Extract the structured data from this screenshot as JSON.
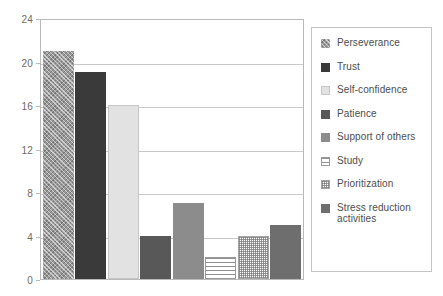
{
  "chart_data": {
    "type": "bar",
    "title": "",
    "subtitle": "",
    "xlabel": "",
    "ylabel": "",
    "ylim": [
      0,
      24
    ],
    "yticks": [
      0,
      4,
      8,
      12,
      16,
      20,
      24
    ],
    "ytick_labels": [
      "0",
      "4",
      "8",
      "12",
      "16",
      "20",
      "24"
    ],
    "grid": true,
    "grid_axis": "y",
    "legend_position": "right",
    "legend_boxed": true,
    "categories": [
      "Perseverance",
      "Trust",
      "Self-confidence",
      "Patience",
      "Support of others",
      "Study",
      "Prioritization",
      "Stress reduction activities"
    ],
    "values": [
      21,
      19,
      16,
      4,
      7,
      2,
      4,
      5
    ],
    "bars": [
      {
        "label": "Perseverance",
        "value": 21,
        "color": "#9a9a9a",
        "fill": "diagonal-crosshatch"
      },
      {
        "label": "Trust",
        "value": 19,
        "color": "#3a3a3a",
        "fill": "solid"
      },
      {
        "label": "Self-confidence",
        "value": 16,
        "color": "#e2e2e2",
        "fill": "solid-light"
      },
      {
        "label": "Patience",
        "value": 4,
        "color": "#585858",
        "fill": "solid"
      },
      {
        "label": "Support of others",
        "value": 7,
        "color": "#8c8c8c",
        "fill": "solid"
      },
      {
        "label": "Study",
        "value": 2,
        "color": "#ffffff",
        "fill": "horizontal-lines"
      },
      {
        "label": "Prioritization",
        "value": 4,
        "color": "#ffffff",
        "fill": "checker-dots"
      },
      {
        "label": "Stress reduction activities",
        "value": 5,
        "color": "#6e6e6e",
        "fill": "solid"
      }
    ],
    "legend": [
      {
        "label": "Perseverance",
        "color": "#9a9a9a",
        "fill": "diagonal-crosshatch"
      },
      {
        "label": "Trust",
        "color": "#3a3a3a",
        "fill": "solid"
      },
      {
        "label": "Self-confidence",
        "color": "#e2e2e2",
        "fill": "solid-light"
      },
      {
        "label": "Patience",
        "color": "#585858",
        "fill": "solid"
      },
      {
        "label": "Support of others",
        "color": "#8c8c8c",
        "fill": "solid"
      },
      {
        "label": "Study",
        "color": "#ffffff",
        "fill": "horizontal-lines"
      },
      {
        "label": "Prioritization",
        "color": "#ffffff",
        "fill": "checker-dots"
      },
      {
        "label": "Stress reduction activities",
        "color": "#6e6e6e",
        "fill": "solid"
      }
    ],
    "colors": {
      "plot_border": "#b9b9b9",
      "gridline": "#c9c9c9",
      "legend_border": "#c4c4c4",
      "tick_text": "#6b6b6b",
      "legend_text": "#4d4d4d",
      "background": "#ffffff"
    }
  }
}
